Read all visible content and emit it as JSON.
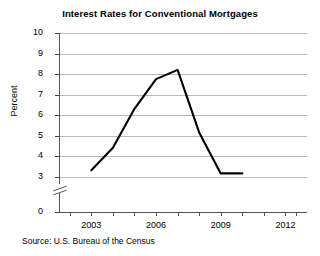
{
  "chart_data": {
    "type": "line",
    "title": "Interest Rates for Conventional Mortgages",
    "xlabel": "",
    "ylabel": "Percent",
    "source": "Source: U.S. Bureau of the Census",
    "x": [
      2003,
      2004,
      2005,
      2006,
      2007,
      2008,
      2009,
      2010
    ],
    "values": [
      3.3,
      4.4,
      6.3,
      7.75,
      8.2,
      5.15,
      3.15,
      3.15
    ],
    "series": [
      {
        "name": "Interest rate",
        "values": [
          3.3,
          4.4,
          6.3,
          7.75,
          8.2,
          5.15,
          3.15,
          3.15
        ]
      }
    ],
    "xlim": [
      2001.5,
      2013.0
    ],
    "ylim": [
      3,
      10
    ],
    "y_axis_broken": true,
    "y_break_between": [
      0,
      3
    ],
    "ytick_labels": [
      "10",
      "9",
      "8",
      "7",
      "6",
      "5",
      "4",
      "3",
      "0"
    ],
    "ytick_values": [
      10,
      9,
      8,
      7,
      6,
      5,
      4,
      3,
      0
    ],
    "xtick_labels": [
      "2003",
      "2006",
      "2009",
      "2012"
    ],
    "xtick_values": [
      2003,
      2006,
      2009,
      2012
    ],
    "xtick_minor_values": [
      2002,
      2004,
      2005,
      2007,
      2008,
      2010,
      2011,
      2012.5
    ],
    "grid": "horizontal",
    "legend": "none",
    "line_color": "#000000",
    "grid_color": "#b9b9b9"
  }
}
